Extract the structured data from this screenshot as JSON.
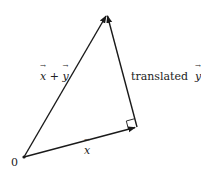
{
  "diagram": {
    "type": "vector-addition",
    "origin_label": "0",
    "vectors": [
      {
        "name": "x",
        "label": "x",
        "from": [
          24,
          157
        ],
        "to": [
          137,
          127
        ]
      },
      {
        "name": "x_plus_y",
        "label": "x + y",
        "from": [
          24,
          157
        ],
        "to": [
          107,
          14
        ]
      },
      {
        "name": "translated_y",
        "label": "translated y",
        "from": [
          137,
          127
        ],
        "to": [
          107,
          14
        ]
      }
    ],
    "labels": {
      "origin": "0",
      "x": "x",
      "sum_x": "x",
      "sum_plus": "+",
      "sum_y": "y",
      "translated_text": "translated",
      "translated_y": "y"
    },
    "right_angle_at": [
      137,
      127
    ],
    "stroke_color": "#1a1a1a"
  }
}
